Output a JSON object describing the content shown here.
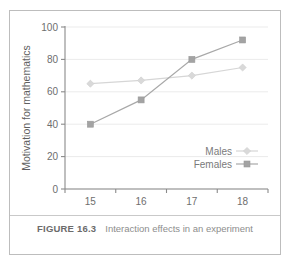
{
  "figure": {
    "caption_label": "FIGURE 16.3",
    "caption_text": "Interaction effects in an experiment"
  },
  "chart_data": {
    "type": "line",
    "title": "",
    "xlabel": "Age",
    "ylabel": "Motivation for mathematics",
    "categories": [
      "15",
      "16",
      "17",
      "18"
    ],
    "series": [
      {
        "name": "Males",
        "values": [
          65,
          67,
          70,
          75
        ],
        "color": "#d6d6d6",
        "marker": "diamond"
      },
      {
        "name": "Females",
        "values": [
          40,
          55,
          80,
          92
        ],
        "color": "#a3a3a3",
        "marker": "square"
      }
    ],
    "ylim": [
      0,
      100
    ],
    "yticks": [
      "0",
      "20",
      "40",
      "60",
      "80",
      "100"
    ],
    "grid": true,
    "legend_position": "inside-bottom-right"
  }
}
